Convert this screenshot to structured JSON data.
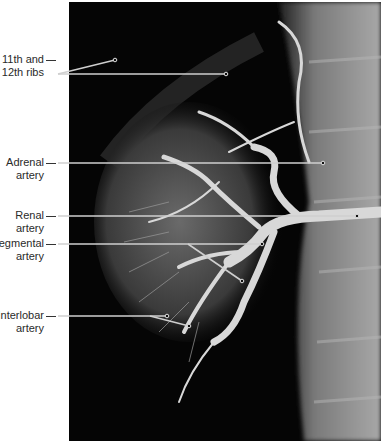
{
  "figure": {
    "labels": [
      {
        "id": "ribs",
        "line1": "11th and",
        "line2": "12th ribs",
        "top": 53
      },
      {
        "id": "adrenal",
        "line1": "Adrenal",
        "line2": "artery",
        "top": 156
      },
      {
        "id": "renal",
        "line1": "Renal",
        "line2": "artery",
        "top": 209
      },
      {
        "id": "segmental",
        "line1": "Segmental",
        "line2": "artery",
        "top": 237
      },
      {
        "id": "interlobar",
        "line1": "Interlobar",
        "line2": "artery",
        "top": 309
      }
    ],
    "colors": {
      "background": "#ffffff",
      "xray_dark": "#050505",
      "vessel": "#d8d8d8",
      "bone": "#9a9a9a",
      "leader": "#cfcfcf",
      "label_text": "#2a2a2a"
    }
  }
}
